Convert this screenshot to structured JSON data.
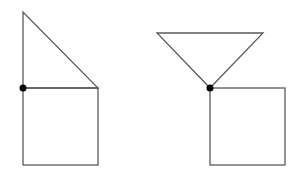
{
  "canvas": {
    "width": 304,
    "height": 183,
    "background": "#ffffff"
  },
  "colors": {
    "stroke": "#5a5a5a",
    "dot": "#000000"
  },
  "figures": [
    {
      "name": "left-figure",
      "description": "right triangle stacked on square, pivot at left corner",
      "triangle": {
        "points": [
          [
            23,
            12
          ],
          [
            23,
            88
          ],
          [
            98,
            88
          ]
        ]
      },
      "square": {
        "x": 23,
        "y": 88,
        "width": 75,
        "height": 77
      },
      "pivot": {
        "cx": 23,
        "cy": 88,
        "r": 3.5
      }
    },
    {
      "name": "right-figure",
      "description": "inverted triangle balanced on square corner, pivot at apex",
      "triangle": {
        "points": [
          [
            157,
            33
          ],
          [
            263,
            33
          ],
          [
            210,
            88
          ]
        ]
      },
      "square": {
        "x": 210,
        "y": 88,
        "width": 75,
        "height": 77
      },
      "pivot": {
        "cx": 210,
        "cy": 88,
        "r": 3.5
      }
    }
  ]
}
